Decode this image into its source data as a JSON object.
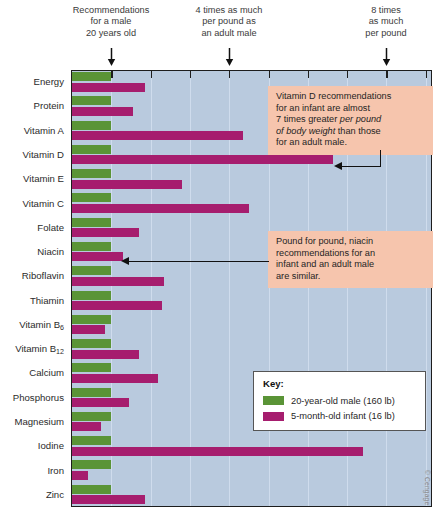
{
  "top_notes": [
    {
      "text": "Recommendations\nfor a male\n20 years old",
      "at_multiple": 1
    },
    {
      "text": "4 times as much\nper pound as\nan adult male",
      "at_multiple": 4
    },
    {
      "text": "8 times\nas much\nper pound",
      "at_multiple": 8
    }
  ],
  "callouts": [
    {
      "id": "vitamin-d-callout",
      "line1": "Vitamin D recommendations",
      "line2": "for an infant are almost",
      "line3a": "7 times greater ",
      "line3b": "per pound",
      "line4a": "of body weight",
      "line4b": " than those",
      "line5": "for an adult male."
    },
    {
      "id": "niacin-callout",
      "line1": "Pound for pound, niacin",
      "line2": "recommendations for an",
      "line3": "infant and an adult male",
      "line4": "are similar."
    }
  ],
  "key": {
    "title": "Key:",
    "entries": [
      {
        "label": "20-year-old male (160 lb)",
        "color": "#5a9436"
      },
      {
        "label": "5-month-old infant (16 lb)",
        "color": "#a61d6e"
      }
    ]
  },
  "credit": "© Cengage",
  "chart_data": {
    "type": "bar",
    "orientation": "horizontal",
    "title": "",
    "xlabel": "Nutrient recommendation per pound of body weight (multiples of the adult male value)",
    "ylabel": "",
    "xlim": [
      0,
      9.2
    ],
    "xticks": [
      1,
      2,
      3,
      4,
      5,
      6,
      7,
      8,
      9
    ],
    "grid": true,
    "legend_position": "inside-lower-right",
    "categories": [
      "Energy",
      "Protein",
      "Vitamin A",
      "Vitamin D",
      "Vitamin E",
      "Vitamin C",
      "Folate",
      "Niacin",
      "Riboflavin",
      "Thiamin",
      "Vitamin B6",
      "Vitamin B12",
      "Calcium",
      "Phosphorus",
      "Magnesium",
      "Iodine",
      "Iron",
      "Zinc"
    ],
    "category_labels_html": [
      "Energy",
      "Protein",
      "Vitamin A",
      "Vitamin D",
      "Vitamin E",
      "Vitamin C",
      "Folate",
      "Niacin",
      "Riboflavin",
      "Thiamin",
      "Vitamin B<sub>6</sub>",
      "Vitamin B<sub>12</sub>",
      "Calcium",
      "Phosphorus",
      "Magnesium",
      "Iodine",
      "Iron",
      "Zinc"
    ],
    "series": [
      {
        "name": "20-year-old male (160 lb)",
        "color": "#5a9436",
        "values": [
          1,
          1,
          1,
          1,
          1,
          1,
          1,
          1,
          1,
          1,
          1,
          1,
          1,
          1,
          1,
          1,
          1,
          1
        ]
      },
      {
        "name": "5-month-old infant (16 lb)",
        "color": "#a61d6e",
        "values": [
          1.85,
          1.55,
          4.35,
          6.65,
          2.8,
          4.5,
          1.7,
          1.3,
          2.35,
          2.3,
          0.85,
          1.7,
          2.2,
          1.45,
          0.75,
          7.4,
          0.4,
          1.85
        ]
      }
    ]
  }
}
